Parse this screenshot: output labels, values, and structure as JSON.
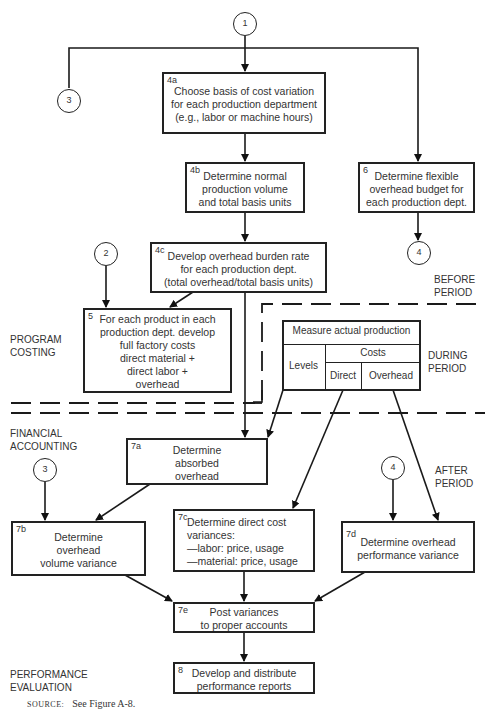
{
  "connectors": {
    "c1_top": "1",
    "c3_top": "3",
    "c2": "2",
    "c4_top": "4",
    "c3_bottom": "3",
    "c4_bottom": "4"
  },
  "boxes": {
    "b4a": {
      "num": "4a",
      "lines": [
        "Choose basis of cost variation",
        "for each production department",
        "(e.g., labor or machine hours)"
      ]
    },
    "b4b": {
      "num": "4b",
      "lines": [
        "Determine normal",
        "production volume",
        "and total basis units"
      ]
    },
    "b6": {
      "num": "6",
      "lines": [
        "Determine flexible",
        "overhead budget for",
        "each production dept."
      ]
    },
    "b4c": {
      "num": "4c",
      "lines": [
        "Develop overhead burden rate",
        "for each production dept.",
        "(total overhead/total basis units)"
      ]
    },
    "b5": {
      "num": "5",
      "lines": [
        "For each product in each",
        "production dept. develop",
        "full factory costs",
        "direct material +",
        "direct labor +",
        "overhead"
      ]
    },
    "b7a": {
      "num": "7a",
      "lines": [
        "Determine",
        "absorbed",
        "overhead"
      ]
    },
    "b7b": {
      "num": "7b",
      "lines": [
        "Determine",
        "overhead",
        "volume variance"
      ]
    },
    "b7c": {
      "num": "7c",
      "lines": [
        "Determine direct cost",
        "variances:",
        "—labor: price, usage",
        "—material: price, usage"
      ]
    },
    "b7d": {
      "num": "7d",
      "lines": [
        "Determine overhead",
        "performance variance"
      ]
    },
    "b7e": {
      "num": "7e",
      "lines": [
        "Post variances",
        "to proper accounts"
      ]
    },
    "b8": {
      "num": "8",
      "lines": [
        "Develop and distribute",
        "performance reports"
      ]
    }
  },
  "measure_table": {
    "title": "Measure actual production",
    "levels": "Levels",
    "costs": "Costs",
    "direct": "Direct",
    "overhead": "Overhead"
  },
  "phase_labels": {
    "before": [
      "BEFORE",
      "PERIOD"
    ],
    "during": [
      "DURING",
      "PERIOD"
    ],
    "after": [
      "AFTER",
      "PERIOD"
    ]
  },
  "section_labels": {
    "program_costing": [
      "PROGRAM",
      "COSTING"
    ],
    "financial_accounting": [
      "FINANCIAL",
      "ACCOUNTING"
    ],
    "performance_evaluation": [
      "PERFORMANCE",
      "EVALUATION"
    ]
  },
  "source": {
    "label": "SOURCE:",
    "text": "See Figure A-8."
  }
}
